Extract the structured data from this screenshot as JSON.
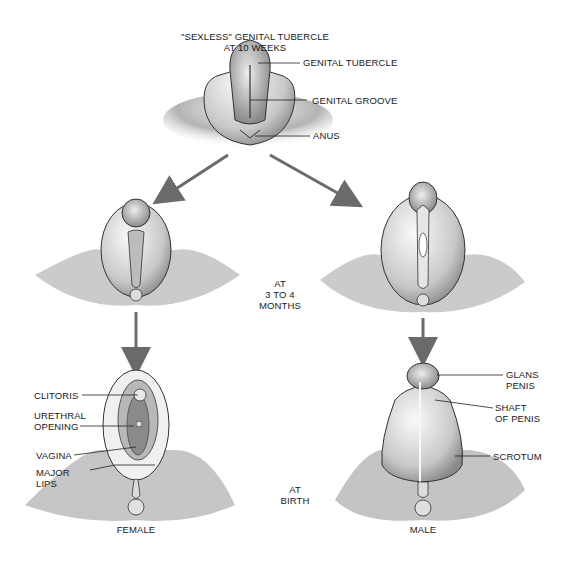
{
  "title": {
    "line1": "\"SEXLESS\" GENITAL TUBERCLE",
    "line2": "AT 10 WEEKS"
  },
  "stage_labels": {
    "months": {
      "line1": "AT",
      "line2": "3 TO 4",
      "line3": "MONTHS"
    },
    "birth": {
      "line1": "AT",
      "line2": "BIRTH"
    }
  },
  "top_labels": {
    "genital_tubercle": "GENITAL TUBERCLE",
    "genital_groove": "GENITAL GROOVE",
    "anus": "ANUS"
  },
  "female_labels": {
    "clitoris": "CLITORIS",
    "urethral_1": "URETHRAL",
    "urethral_2": "OPENING",
    "vagina": "VAGINA",
    "major_1": "MAJOR",
    "major_2": "LIPS",
    "caption": "FEMALE"
  },
  "male_labels": {
    "glans_1": "GLANS",
    "glans_2": "PENIS",
    "shaft_1": "SHAFT",
    "shaft_2": "OF PENIS",
    "scrotum": "SCROTUM",
    "caption": "MALE"
  },
  "colors": {
    "arrow": "#6a6a6a",
    "tissue_light": "#e4e4e4",
    "tissue_dark": "#7a7a7a",
    "outline": "#222222"
  }
}
